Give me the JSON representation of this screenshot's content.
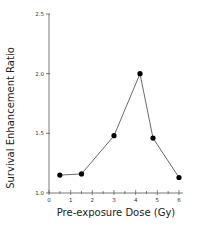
{
  "chart_data": {
    "type": "line",
    "title": "",
    "xlabel": "Pre-exposure Dose (Gy)",
    "ylabel": "Survival Enhancement Ratio",
    "xlim": [
      0,
      6
    ],
    "ylim": [
      1.0,
      2.5
    ],
    "x_ticks": [
      "0",
      "1",
      "2",
      "3",
      "4",
      "5",
      "6"
    ],
    "y_ticks": [
      "1.0",
      "1.5",
      "2.0",
      "2.5"
    ],
    "grid": false,
    "legend": null,
    "series": [
      {
        "name": "Survival Enhancement Ratio",
        "marker": "filled-circle",
        "color": "#000000",
        "x": [
          0.5,
          1.5,
          3.0,
          4.2,
          4.8,
          6.0
        ],
        "y": [
          1.15,
          1.16,
          1.48,
          2.0,
          1.46,
          1.13
        ]
      }
    ]
  }
}
